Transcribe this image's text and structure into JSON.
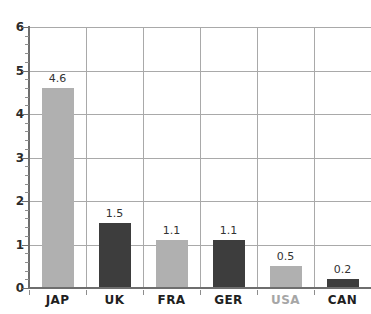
{
  "chart_data": {
    "type": "bar",
    "title": "",
    "subtitle": "",
    "xlabel": "",
    "ylabel": "",
    "categories": [
      "JAP",
      "UK",
      "FRA",
      "GER",
      "USA",
      "CAN"
    ],
    "values": [
      4.6,
      1.5,
      1.1,
      1.1,
      0.5,
      0.2
    ],
    "value_labels": [
      "4.6",
      "1.5",
      "1.1",
      "1.1",
      "0.5",
      "0.2"
    ],
    "bar_colors": [
      "#b0b0b0",
      "#3d3d3d",
      "#b0b0b0",
      "#3d3d3d",
      "#b0b0b0",
      "#3d3d3d"
    ],
    "category_label_colors": [
      "#1f1f1f",
      "#1f1f1f",
      "#1f1f1f",
      "#1f1f1f",
      "#a6a6a6",
      "#1f1f1f"
    ],
    "ylim": [
      0,
      6
    ],
    "y_ticks": [
      0,
      1,
      2,
      3,
      4,
      5,
      6
    ],
    "y_tick_labels": [
      "0",
      "1",
      "2",
      "3",
      "4",
      "5",
      "6"
    ],
    "y_minor_tick_step": 0.2,
    "grid": true,
    "grid_axis": "both",
    "grid_color": "#a9a9a9",
    "legend": false,
    "legend_position": "none",
    "background_color": "#ffffff",
    "axis_color": "#6e6e6e"
  }
}
